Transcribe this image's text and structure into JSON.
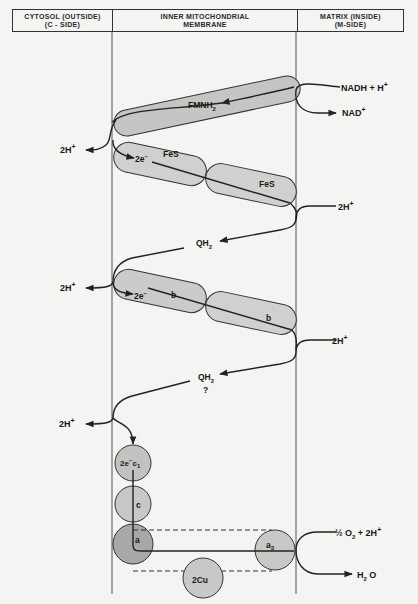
{
  "header": {
    "cytosol_line1": "CYTOSOL (OUTSIDE)",
    "cytosol_line2": "(C - SIDE)",
    "membrane_line1": "INNER MITOCHONDRIAL",
    "membrane_line2": "MEMBRANE",
    "matrix_line1": "MATRIX (INSIDE)",
    "matrix_line2": "(M-SIDE)"
  },
  "colors": {
    "background": "#f4f4f2",
    "line": "#222222",
    "complex_fill_light": "#c9c9c7",
    "complex_fill_dark": "#a9a9a7"
  },
  "labels": {
    "nadh": "NADH + H",
    "nadh_sup": "+",
    "nad": "NAD",
    "nad_sup": "+",
    "fmnh2": "FMNH",
    "fmnh2_sub": "2",
    "two_e_1": "2e",
    "two_e_1_sup": "−",
    "fes_1": "FeS",
    "fes_2": "FeS",
    "h_out_1": "2H",
    "h_out_1_sup": "+",
    "h_in_1": "2H",
    "h_in_1_sup": "+",
    "qh2_1": "QH",
    "qh2_1_sub": "2",
    "h_out_2": "2H",
    "h_out_2_sup": "+",
    "two_e_2": "2e",
    "two_e_2_sup": "−",
    "b_1": "b",
    "b_2": "b",
    "h_in_2": "2H",
    "h_in_2_sup": "+",
    "qh2_2": "QH",
    "qh2_2_sub": "2",
    "question": "?",
    "h_out_3": "2H",
    "h_out_3_sup": "+",
    "c1": "2e",
    "c1_sup": "−",
    "c1_name": "c",
    "c1_sub": "1",
    "c": "c",
    "a": "a",
    "a3": "a",
    "a3_sub": "3",
    "cu": "2Cu",
    "oxygen_half": "½ O",
    "oxygen_sub": "2",
    "oxygen_rest": " + 2H",
    "oxygen_sup": "+",
    "water": "H",
    "water_sub": "2",
    "water_rest": " O"
  }
}
